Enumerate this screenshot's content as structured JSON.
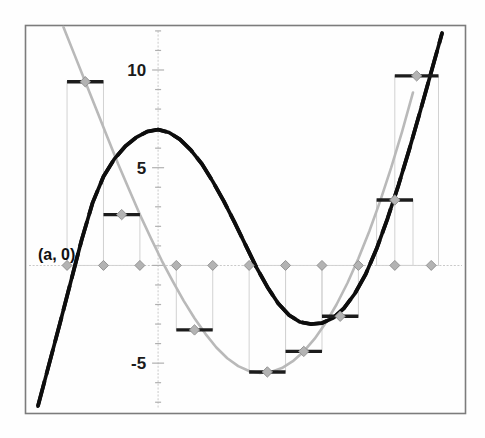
{
  "figure": {
    "title": "",
    "background_color": "#fefefe",
    "frame_color": "#7c7c7c",
    "annotation": {
      "name": "point-a-label",
      "text": "(a, 0)",
      "x_px": 38,
      "y_px": 260
    }
  },
  "axes": {
    "x_axis_label": "",
    "y_axis_label": "",
    "y_tick_labels": [
      "10",
      "5",
      "-5"
    ],
    "y_tick_values": [
      10,
      5,
      -5
    ],
    "x_tick_labels": [],
    "grid": false,
    "zero_line": true
  },
  "chart_data": {
    "type": "line",
    "title": "",
    "subtitle": "",
    "xlabel": "",
    "ylabel": "",
    "xlim": [
      0,
      12
    ],
    "ylim": [
      -7.5,
      12.2
    ],
    "grid": false,
    "legend": "none",
    "y_ticks": [
      10,
      5,
      -5
    ],
    "y_tick_labels": [
      "10",
      "5",
      "-5"
    ],
    "annotations": [
      {
        "text": "(a, 0)",
        "x": 0.55,
        "y": 1.5
      }
    ],
    "series": [
      {
        "name": "black-curve",
        "style": "solid-dashed-thick",
        "color": "#0d0d0d",
        "x": [
          0.3,
          0.6,
          0.9,
          1.2,
          1.5,
          1.8,
          2.1,
          2.4,
          2.7,
          3.0,
          3.3,
          3.6,
          3.9,
          4.2,
          4.5,
          4.8,
          5.1,
          5.4,
          5.7,
          6.0,
          6.3,
          6.6,
          6.9,
          7.2,
          7.5,
          7.8,
          8.1,
          8.4,
          8.7,
          9.0,
          9.3,
          9.6,
          9.9,
          10.2,
          10.5,
          10.8,
          11.1,
          11.4
        ],
        "y": [
          -7.2,
          -5.1,
          -3.0,
          -0.85,
          1.3,
          3.2,
          4.55,
          5.45,
          6.1,
          6.55,
          6.85,
          6.95,
          6.8,
          6.45,
          5.9,
          5.2,
          4.3,
          3.3,
          2.2,
          1.05,
          -0.1,
          -1.1,
          -1.95,
          -2.55,
          -2.9,
          -3.0,
          -2.95,
          -2.7,
          -2.2,
          -1.45,
          -0.45,
          0.85,
          2.4,
          4.1,
          5.95,
          7.9,
          9.9,
          11.9
        ]
      },
      {
        "name": "gray-curve",
        "style": "solid-thin",
        "color": "#b9b9b9",
        "x": [
          1.0,
          1.3,
          1.6,
          1.9,
          2.2,
          2.5,
          2.8,
          3.1,
          3.4,
          3.7,
          4.0,
          4.3,
          4.6,
          4.9,
          5.2,
          5.5,
          5.8,
          6.1,
          6.4,
          6.7,
          7.0,
          7.3,
          7.6,
          7.9,
          8.2,
          8.5,
          8.8,
          9.1,
          9.4,
          9.7,
          10.0,
          10.3,
          10.6
        ],
        "y": [
          12.2,
          10.8,
          9.4,
          8.0,
          6.6,
          5.2,
          3.9,
          2.6,
          1.4,
          0.25,
          -0.8,
          -1.8,
          -2.7,
          -3.5,
          -4.2,
          -4.75,
          -5.15,
          -5.4,
          -5.5,
          -5.45,
          -5.25,
          -4.9,
          -4.4,
          -3.75,
          -2.95,
          -2.0,
          -0.9,
          0.35,
          1.75,
          3.3,
          5.0,
          6.85,
          8.85
        ]
      }
    ],
    "rectangles": {
      "name": "riemann-rectangles",
      "count": 11,
      "edge_color": "#d2d2d2",
      "cap_color": "#1c1c1c",
      "marker_color": "#b3b3b3",
      "items": [
        {
          "index": 1,
          "x_left": 1.1,
          "x_right": 2.1,
          "x_mid": 1.6,
          "height": 9.4
        },
        {
          "index": 2,
          "x_left": 2.1,
          "x_right": 3.1,
          "x_mid": 2.6,
          "height": 2.6
        },
        {
          "index": 3,
          "x_left": 3.1,
          "x_right": 4.1,
          "x_mid": 3.6,
          "height": 0.0
        },
        {
          "index": 4,
          "x_left": 4.1,
          "x_right": 5.1,
          "x_mid": 4.6,
          "height": -3.3
        },
        {
          "index": 5,
          "x_left": 5.1,
          "x_right": 6.1,
          "x_mid": 5.6,
          "height": 0.0
        },
        {
          "index": 6,
          "x_left": 6.1,
          "x_right": 7.1,
          "x_mid": 6.6,
          "height": -5.45
        },
        {
          "index": 7,
          "x_left": 7.1,
          "x_right": 8.1,
          "x_mid": 7.6,
          "height": -4.4
        },
        {
          "index": 8,
          "x_left": 8.1,
          "x_right": 9.1,
          "x_mid": 8.6,
          "height": -2.6
        },
        {
          "index": 9,
          "x_left": 9.1,
          "x_right": 10.1,
          "x_mid": 9.6,
          "height": 0.0
        },
        {
          "index": 10,
          "x_left": 9.6,
          "x_right": 10.6,
          "x_mid": 10.1,
          "height": 3.35
        },
        {
          "index": 11,
          "x_left": 10.1,
          "x_right": 11.3,
          "x_mid": 10.7,
          "height": 9.7
        }
      ]
    },
    "axis_markers": {
      "name": "x-axis-diamond-markers",
      "color": "#b3b3b3",
      "x_values": [
        1.1,
        2.1,
        3.1,
        4.1,
        5.1,
        6.1,
        7.1,
        8.1,
        9.1,
        10.1,
        11.1
      ],
      "y_value": 0
    }
  }
}
